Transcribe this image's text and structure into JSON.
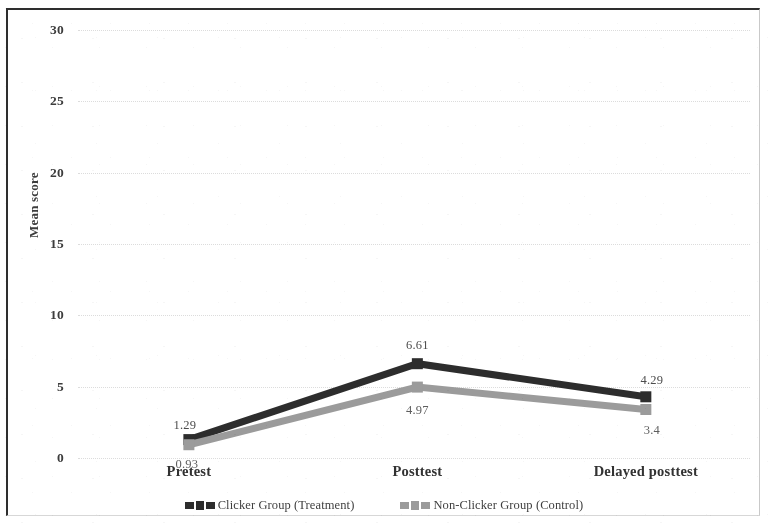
{
  "chart_data": {
    "type": "line",
    "title": "",
    "xlabel": "",
    "ylabel": "Mean score",
    "categories": [
      "Pretest",
      "Posttest",
      "Delayed posttest"
    ],
    "ylim": [
      0,
      30
    ],
    "yticks": [
      0,
      5,
      10,
      15,
      20,
      25,
      30
    ],
    "ytick_labels": [
      "0",
      "5",
      "10",
      "15",
      "20",
      "25",
      "30"
    ],
    "grid": true,
    "legend_position": "bottom-center",
    "series": [
      {
        "name": "Clicker Group (Treatment)",
        "color": "#2a2a2a",
        "marker": "square",
        "values": [
          1.29,
          6.61,
          4.29
        ],
        "labels": [
          "1.29",
          "6.61",
          "4.29"
        ]
      },
      {
        "name": "Non-Clicker Group (Control)",
        "color": "#9a9a9a",
        "marker": "square",
        "values": [
          0.93,
          4.97,
          3.4
        ],
        "labels": [
          "0.93",
          "4.97",
          "3.4"
        ]
      }
    ]
  },
  "axes": {
    "y_title": "Mean score",
    "y_ticks": [
      "30",
      "25",
      "20",
      "15",
      "10",
      "5",
      "0"
    ],
    "x_ticks": [
      "Pretest",
      "Posttest",
      "Delayed posttest"
    ]
  },
  "legend": {
    "entries": [
      {
        "label": "Clicker Group (Treatment)",
        "color": "#2a2a2a"
      },
      {
        "label": "Non-Clicker Group (Control)",
        "color": "#9a9a9a"
      }
    ]
  }
}
